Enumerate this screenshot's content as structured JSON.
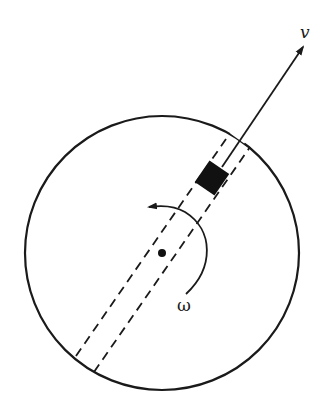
{
  "diagram": {
    "labels": {
      "velocity": "v",
      "angular_velocity": "ω"
    },
    "elements": [
      {
        "id": "disk",
        "kind": "circle",
        "description": "rotating disk"
      },
      {
        "id": "groove",
        "kind": "dashed-parallel-lines",
        "description": "radial slot through disk"
      },
      {
        "id": "block",
        "kind": "filled-rectangle",
        "description": "sliding mass in slot"
      },
      {
        "id": "center",
        "kind": "dot",
        "description": "axis of rotation"
      },
      {
        "id": "velocity-arrow",
        "kind": "arrow",
        "label": "v",
        "description": "velocity of block along slot"
      },
      {
        "id": "rotation-arrow",
        "kind": "curved-arrow",
        "label": "ω",
        "description": "counter-clockwise rotation"
      }
    ],
    "colors": {
      "ink": "#1a1a1a",
      "background": "#ffffff"
    }
  }
}
